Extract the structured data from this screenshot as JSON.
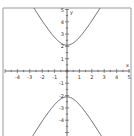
{
  "chart_data": {
    "type": "line",
    "title": "",
    "xlabel": "x",
    "ylabel": "y",
    "xlim": [
      -5,
      5
    ],
    "ylim": [
      -5.3,
      5.1
    ],
    "grid": false,
    "legend": null,
    "x_ticks": [
      -4,
      -3,
      -2,
      -1,
      1,
      2,
      3,
      4,
      5
    ],
    "y_ticks": [
      5,
      4,
      3,
      2,
      1,
      -1,
      -2,
      -3,
      -4
    ],
    "x_tick_labels": [
      "-4",
      "-3",
      "-2",
      "-1",
      "1",
      "2",
      "3",
      "4",
      "5"
    ],
    "y_tick_labels": [
      "5",
      "4",
      "3",
      "2",
      "1",
      "-1",
      "-2",
      "-3",
      "-4"
    ],
    "minor_tick_step": 0.5,
    "series": [
      {
        "name": "hyperbola upper branch",
        "equation": "y^2/2.1^2 - x^2/1.2^2 = 1, y > 0",
        "points": [
          [
            -2.7,
            5.17
          ],
          [
            -2.0,
            4.08
          ],
          [
            -1.0,
            2.73
          ],
          [
            0,
            2.1
          ],
          [
            1.0,
            2.73
          ],
          [
            2.0,
            4.08
          ],
          [
            2.7,
            5.17
          ]
        ]
      },
      {
        "name": "hyperbola lower branch",
        "equation": "y^2/2.1^2 - x^2/1.2^2 = 1, y < 0",
        "points": [
          [
            -2.7,
            -5.17
          ],
          [
            -2.0,
            -4.08
          ],
          [
            -1.0,
            -2.73
          ],
          [
            0,
            -2.1
          ],
          [
            1.0,
            -2.73
          ],
          [
            2.0,
            -4.08
          ],
          [
            2.7,
            -5.17
          ]
        ]
      }
    ],
    "vertices": [
      [
        0,
        2.1
      ],
      [
        0,
        -2.1
      ]
    ]
  },
  "style": {
    "axis_color": "#444444",
    "curve_color": "#555555",
    "frame_color": "#888888"
  },
  "labels": {
    "x_axis": "x",
    "y_axis": "y"
  }
}
